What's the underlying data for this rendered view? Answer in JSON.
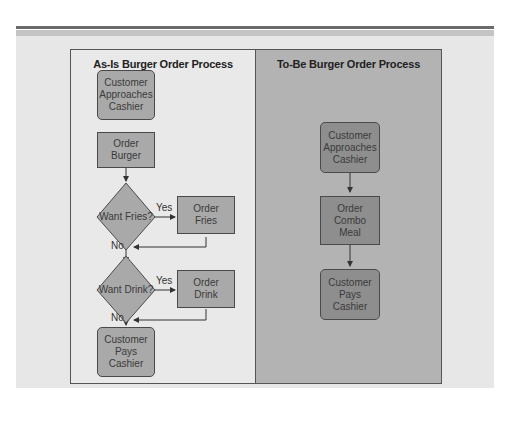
{
  "as_is": {
    "title": "As-Is Burger Order Process",
    "nodes": {
      "approach": "Customer\nApproaches\nCashier",
      "burger": "Order\nBurger",
      "fries_q": "Want Fries?",
      "fries": "Order\nFries",
      "drink_q": "Want Drink?",
      "drink": "Order\nDrink",
      "pay": "Customer\nPays\nCashier"
    },
    "labels": {
      "yes1": "Yes",
      "no1": "No",
      "yes2": "Yes",
      "no2": "No"
    }
  },
  "to_be": {
    "title": "To-Be Burger Order Process",
    "nodes": {
      "approach": "Customer\nApproaches\nCashier",
      "combo": "Order\nCombo\nMeal",
      "pay": "Customer\nPays\nCashier"
    }
  },
  "colors": {
    "light_box": "#a9a9a9",
    "dark_box": "#8e8e8e",
    "left_bg": "#e9e9e9",
    "right_bg": "#b3b3b3"
  }
}
